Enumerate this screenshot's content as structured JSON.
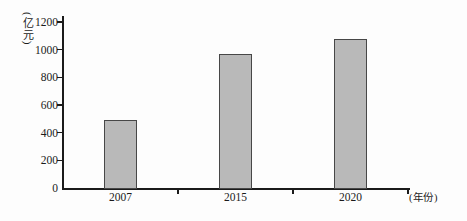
{
  "chart_data": {
    "type": "bar",
    "title": "",
    "categories": [
      "2007",
      "2015",
      "2020"
    ],
    "values": [
      490,
      970,
      1080
    ],
    "series": [
      {
        "name": "value",
        "values": [
          490,
          970,
          1080
        ]
      }
    ],
    "xlabel": "(年份)",
    "ylabel": "(亿元)",
    "ylim": [
      0,
      1200
    ],
    "yticks": [
      0,
      200,
      400,
      600,
      800,
      1000,
      1200
    ],
    "ytick_step": 200,
    "grid": false,
    "legend_position": "none",
    "bar_fill_color": "#b9b9b9",
    "bar_border_color": "#474747",
    "axis_color": "#1b1b1b",
    "background_color": "#fdfdfd"
  }
}
